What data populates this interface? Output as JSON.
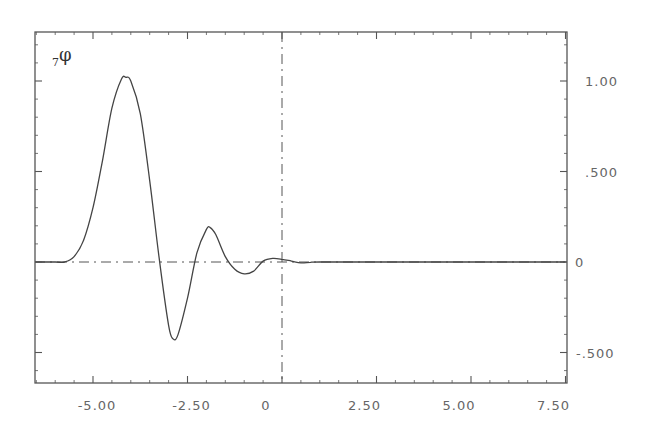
{
  "chart_data": {
    "type": "line",
    "title": "",
    "xlabel": "",
    "ylabel": "",
    "series_label": {
      "subscript": "7",
      "symbol": "φ"
    },
    "xlim": [
      -6.53,
      7.5
    ],
    "ylim": [
      -0.67,
      1.27
    ],
    "grid": false,
    "legend": "none",
    "y_axis_side": "right",
    "x_ticks": [
      -5.0,
      -2.5,
      0,
      2.5,
      5.0,
      7.5
    ],
    "x_tick_labels": [
      "-5.00",
      "-2.50",
      "0",
      "2.50",
      "5.00",
      "7.50"
    ],
    "y_ticks": [
      1.0,
      0.5,
      0,
      -0.5
    ],
    "y_tick_labels": [
      "1.00",
      ".500",
      "0",
      "-.500"
    ],
    "reference_lines": [
      {
        "orientation": "horizontal",
        "value": 0,
        "style": "dash-dot"
      },
      {
        "orientation": "vertical",
        "value": 0,
        "style": "dash-dot"
      }
    ],
    "series": [
      {
        "name": "7φ",
        "x": [
          -6.53,
          -6.0,
          -5.75,
          -5.5,
          -5.25,
          -5.0,
          -4.75,
          -4.5,
          -4.25,
          -4.13,
          -4.0,
          -3.75,
          -3.5,
          -3.25,
          -3.0,
          -2.88,
          -2.75,
          -2.5,
          -2.25,
          -2.0,
          -1.9,
          -1.75,
          -1.5,
          -1.25,
          -1.0,
          -0.75,
          -0.5,
          -0.25,
          0.0,
          0.25,
          0.5,
          0.75,
          1.0,
          2.5,
          5.0,
          7.5
        ],
        "values": [
          0,
          0,
          0.0,
          0.03,
          0.12,
          0.3,
          0.56,
          0.85,
          1.01,
          1.02,
          1.0,
          0.82,
          0.45,
          0.02,
          -0.35,
          -0.425,
          -0.4,
          -0.2,
          0.05,
          0.18,
          0.19,
          0.15,
          0.03,
          -0.04,
          -0.065,
          -0.05,
          0.005,
          0.02,
          0.015,
          0.005,
          -0.005,
          -0.002,
          0,
          0,
          0,
          0
        ]
      }
    ]
  }
}
